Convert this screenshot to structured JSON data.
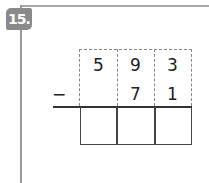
{
  "problem": {
    "number_label": "15.",
    "operator": "−",
    "minuend": [
      "5",
      "9",
      "3"
    ],
    "subtrahend": [
      "",
      "7",
      "1"
    ],
    "answer": [
      "",
      "",
      ""
    ]
  }
}
